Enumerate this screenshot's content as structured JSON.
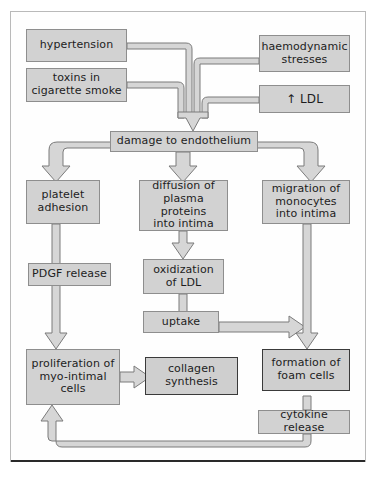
{
  "diagram": {
    "colors": {
      "box_fill": "#d2d2d2",
      "box_border": "#8e8e8e",
      "box_border_dark": "#3a3a3a",
      "arrow_fill": "#d6d6d6",
      "arrow_stroke": "#7b7b7b",
      "frame_border": "#b9b9b9",
      "background": "#ffffff",
      "text": "#1d1d1d"
    },
    "nodes": [
      {
        "id": "hypertension",
        "label": "hypertension",
        "lines": [
          "hypertension"
        ]
      },
      {
        "id": "toxins",
        "label": "toxins in cigarette smoke",
        "lines": [
          "toxins in",
          "cigarette smoke"
        ]
      },
      {
        "id": "haemodynamic",
        "label": "haemodynamic stresses",
        "lines": [
          "haemodynamic",
          "stresses"
        ]
      },
      {
        "id": "ldl",
        "label": "↑ LDL",
        "lines": [
          "↑ LDL"
        ]
      },
      {
        "id": "damage",
        "label": "damage to endothelium",
        "lines": [
          "damage to endothelium"
        ]
      },
      {
        "id": "platelet",
        "label": "platelet adhesion",
        "lines": [
          "platelet",
          "adhesion"
        ]
      },
      {
        "id": "diffusion",
        "label": "diffusion of plasma proteins into intima",
        "lines": [
          "diffusion of",
          "plasma proteins",
          "into intima"
        ]
      },
      {
        "id": "migration",
        "label": "migration of monocytes into intima",
        "lines": [
          "migration of",
          "monocytes",
          "into intima"
        ]
      },
      {
        "id": "pdgf",
        "label": "PDGF release",
        "lines": [
          "PDGF release"
        ]
      },
      {
        "id": "oxidization",
        "label": "oxidization of LDL",
        "lines": [
          "oxidization",
          "of LDL"
        ]
      },
      {
        "id": "uptake",
        "label": "uptake",
        "lines": [
          "uptake"
        ]
      },
      {
        "id": "proliferation",
        "label": "proliferation of myo-intimal cells",
        "lines": [
          "proliferation of",
          "myo-intimal",
          "cells"
        ]
      },
      {
        "id": "collagen",
        "label": "collagen synthesis",
        "lines": [
          "collagen synthesis"
        ]
      },
      {
        "id": "foam",
        "label": "formation of foam cells",
        "lines": [
          "formation of",
          "foam cells"
        ]
      },
      {
        "id": "cytokine",
        "label": "cytokine release",
        "lines": [
          "cytokine release"
        ]
      }
    ],
    "edges": [
      {
        "from": "hypertension",
        "to": "damage"
      },
      {
        "from": "toxins",
        "to": "damage"
      },
      {
        "from": "haemodynamic",
        "to": "damage"
      },
      {
        "from": "ldl",
        "to": "damage"
      },
      {
        "from": "damage",
        "to": "platelet"
      },
      {
        "from": "damage",
        "to": "diffusion"
      },
      {
        "from": "damage",
        "to": "migration"
      },
      {
        "from": "platelet",
        "to": "proliferation"
      },
      {
        "from": "diffusion",
        "to": "oxidization"
      },
      {
        "from": "oxidization",
        "to": "uptake"
      },
      {
        "from": "uptake",
        "to": "foam"
      },
      {
        "from": "migration",
        "to": "foam"
      },
      {
        "from": "proliferation",
        "to": "collagen"
      },
      {
        "from": "foam",
        "to": "cytokine"
      },
      {
        "from": "cytokine",
        "to": "proliferation"
      }
    ]
  }
}
